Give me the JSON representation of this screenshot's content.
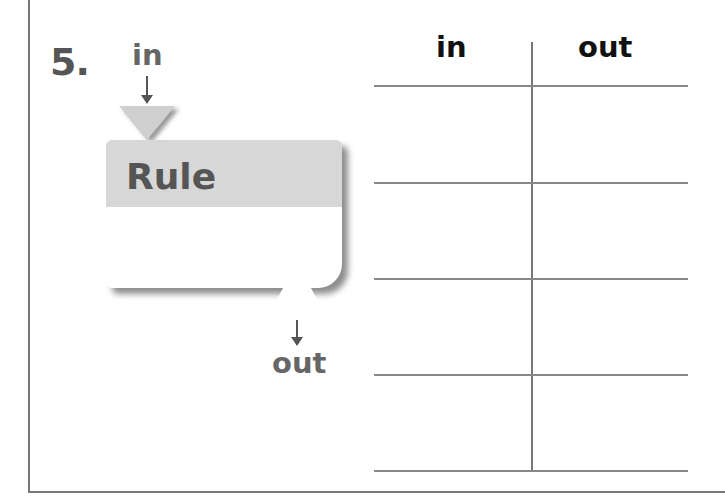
{
  "problem": {
    "number": "5."
  },
  "machine": {
    "title": "Rule",
    "input_label": "in",
    "output_label": "out"
  },
  "table": {
    "columns": [
      "in",
      "out"
    ],
    "rows": [
      [
        "",
        ""
      ],
      [
        "",
        ""
      ],
      [
        "",
        ""
      ],
      [
        "",
        ""
      ]
    ]
  },
  "colors": {
    "machine_header": "#d7d7d7",
    "text_gray": "#555555",
    "border": "#777777"
  }
}
